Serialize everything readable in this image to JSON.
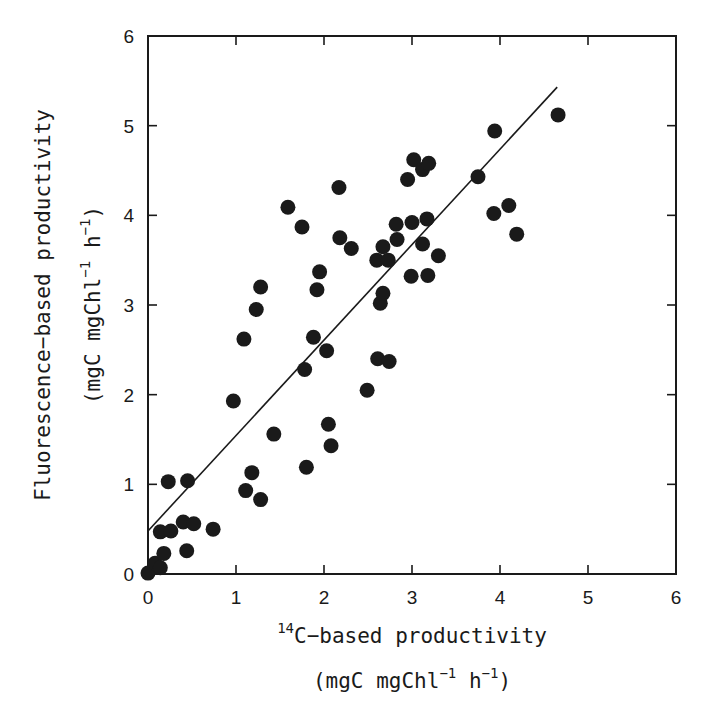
{
  "chart_data": {
    "type": "scatter",
    "title": "",
    "xlabel": "14C-based productivity (mgC mgChl-1 h-1)",
    "ylabel": "Fluorescence-based productivity (mgC mgChl-1 h-1)",
    "xlabel_parts": {
      "superscript": "14",
      "line1": "C−based productivity",
      "line2_prefix": "(mgC mgChl",
      "line2_exp1": "−1",
      "line2_mid": " h",
      "line2_exp2": "−1",
      "line2_suffix": ")"
    },
    "ylabel_parts": {
      "line1": "Fluorescence−based productivity",
      "line2_prefix": "(mgC mgChl",
      "line2_exp1": "−1",
      "line2_mid": " h",
      "line2_exp2": "−1",
      "line2_suffix": ")"
    },
    "xlim": [
      0,
      6
    ],
    "ylim": [
      0,
      6
    ],
    "xticks": [
      "0",
      "1",
      "2",
      "3",
      "4",
      "5",
      "6"
    ],
    "yticks": [
      "0",
      "1",
      "2",
      "3",
      "4",
      "5",
      "6"
    ],
    "grid": false,
    "legend": null,
    "marker": "filled-circle",
    "points": [
      [
        0.0,
        0.01
      ],
      [
        0.08,
        0.12
      ],
      [
        0.14,
        0.07
      ],
      [
        0.18,
        0.23
      ],
      [
        0.44,
        0.26
      ],
      [
        0.14,
        0.47
      ],
      [
        0.26,
        0.48
      ],
      [
        0.4,
        0.58
      ],
      [
        0.52,
        0.56
      ],
      [
        0.74,
        0.5
      ],
      [
        0.23,
        1.03
      ],
      [
        0.45,
        1.04
      ],
      [
        1.11,
        0.93
      ],
      [
        1.18,
        1.13
      ],
      [
        1.28,
        0.83
      ],
      [
        0.97,
        1.93
      ],
      [
        1.43,
        1.56
      ],
      [
        1.8,
        1.19
      ],
      [
        2.05,
        1.67
      ],
      [
        2.08,
        1.43
      ],
      [
        1.78,
        2.28
      ],
      [
        2.03,
        2.49
      ],
      [
        1.88,
        2.64
      ],
      [
        1.09,
        2.62
      ],
      [
        1.23,
        2.95
      ],
      [
        1.28,
        3.2
      ],
      [
        1.92,
        3.17
      ],
      [
        1.95,
        3.37
      ],
      [
        2.49,
        2.05
      ],
      [
        2.61,
        2.4
      ],
      [
        2.74,
        2.37
      ],
      [
        2.64,
        3.02
      ],
      [
        2.67,
        3.13
      ],
      [
        2.99,
        3.32
      ],
      [
        3.18,
        3.33
      ],
      [
        3.3,
        3.55
      ],
      [
        2.6,
        3.5
      ],
      [
        2.73,
        3.5
      ],
      [
        2.67,
        3.65
      ],
      [
        3.12,
        3.68
      ],
      [
        2.83,
        3.73
      ],
      [
        2.82,
        3.9
      ],
      [
        3.0,
        3.92
      ],
      [
        3.17,
        3.96
      ],
      [
        2.18,
        3.75
      ],
      [
        2.31,
        3.63
      ],
      [
        1.75,
        3.87
      ],
      [
        1.59,
        4.09
      ],
      [
        2.17,
        4.31
      ],
      [
        2.95,
        4.4
      ],
      [
        3.02,
        4.62
      ],
      [
        3.12,
        4.51
      ],
      [
        3.19,
        4.58
      ],
      [
        3.75,
        4.43
      ],
      [
        3.93,
        4.02
      ],
      [
        4.1,
        4.11
      ],
      [
        4.19,
        3.79
      ],
      [
        3.94,
        4.94
      ],
      [
        4.66,
        5.12
      ]
    ],
    "regression_line": {
      "x": [
        0.0,
        4.65
      ],
      "y": [
        0.48,
        5.43
      ]
    }
  }
}
